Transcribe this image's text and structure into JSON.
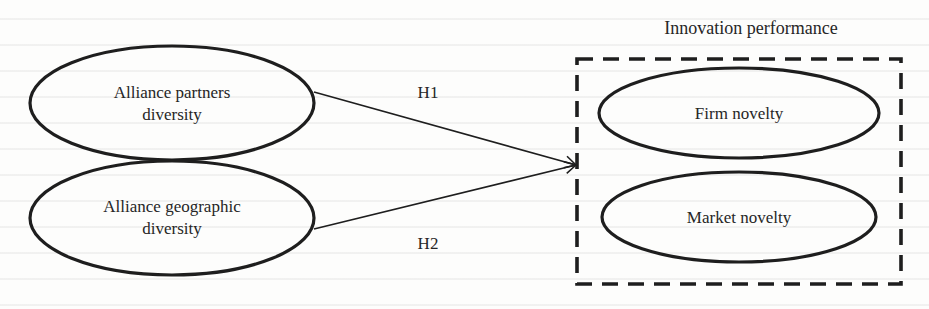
{
  "diagram": {
    "title": "Innovation performance",
    "nodes": {
      "partners": {
        "line1": "Alliance partners",
        "line2": "diversity"
      },
      "geographic": {
        "line1": "Alliance geographic",
        "line2": "diversity"
      },
      "firm_novelty": {
        "label": "Firm novelty"
      },
      "market_novelty": {
        "label": "Market novelty"
      }
    },
    "edges": {
      "h1": {
        "label": "H1",
        "from": "Alliance partners diversity",
        "to": "Innovation performance"
      },
      "h2": {
        "label": "H2",
        "from": "Alliance geographic diversity",
        "to": "Innovation performance"
      }
    },
    "colors": {
      "stroke": "#1e1e1e",
      "background": "#fdfdfc",
      "text": "#262626"
    }
  }
}
